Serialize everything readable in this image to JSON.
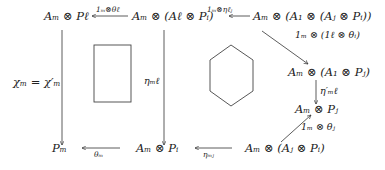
{
  "diagram": {
    "type": "commutative-diagram",
    "nodes": {
      "top_left": "Aₘ ⊗ Pℓ",
      "top_mid": "Aₘ ⊗ (Aℓ ⊗ Pᵢ)",
      "top_right": "Aₘ ⊗ (A₁ ⊗ (Aⱼ ⊗ Pᵢ))",
      "right_upper": "Aₘ ⊗ (A₁ ⊗ Pⱼ)",
      "right_mid": "Aₘ ⊗ Pⱼ",
      "bottom_right": "Aₘ ⊗ (Aⱼ ⊗ Pᵢ)",
      "bottom_mid": "Aₘ ⊗ Pᵢ",
      "bottom_left": "Pₘ"
    },
    "arrows": {
      "top_mid_to_left": "1ₘ⊗θℓ",
      "top_right_to_mid": "1ₘ⊗ηℓⱼ",
      "top_right_to_right_upper": "1ₘ ⊗ (1ℓ ⊗ θᵢ)",
      "right_upper_to_right_mid": "η′ₘℓ",
      "bottom_right_to_right_mid": "1ₘ ⊗ θⱼ",
      "bottom_right_to_bottom_mid": "ηₘⱼ",
      "bottom_mid_to_left": "θₘ",
      "top_mid_to_bottom_mid": "ηₘℓ",
      "top_left_to_bottom_left": "χₘ = χ′ₘ"
    },
    "shapes": [
      "rectangle",
      "hexagon"
    ]
  }
}
